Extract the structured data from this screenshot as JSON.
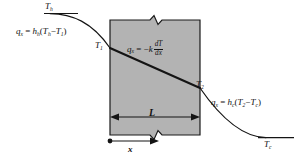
{
  "figure": {
    "colors": {
      "wall_fill": "#b3b3b3",
      "wall_stroke": "#1a1a1a",
      "curve": "#141414",
      "text": "#111111",
      "background": "#ffffff"
    }
  },
  "labels": {
    "hot_fluid_temperature": {
      "symbol": "T",
      "subscript": "h",
      "overline": true
    },
    "cold_fluid_temperature": {
      "symbol": "T",
      "subscript": "c",
      "overline": true
    },
    "wall_surface_hot": {
      "symbol": "T",
      "subscript": "1"
    },
    "wall_surface_cold": {
      "symbol": "T",
      "subscript": "2"
    },
    "wall_thickness": {
      "symbol": "L"
    },
    "axis_x": {
      "symbol": "x"
    }
  },
  "equations": {
    "hot_side_convection": {
      "flux": "q",
      "flux_subscript": "x",
      "equals": "=",
      "coefficient": "h",
      "coefficient_subscript": "h",
      "open_paren": "(",
      "temp1": "T",
      "temp1_subscript": "h",
      "minus": "−",
      "temp2": "T",
      "temp2_subscript": "1",
      "close_paren": ")"
    },
    "conduction_fourier": {
      "flux": "q",
      "flux_subscript": "x",
      "equals": "=",
      "minus": "−",
      "conductivity": "k",
      "numerator": "dT",
      "denominator": "dx"
    },
    "cold_side_convection": {
      "flux": "q",
      "flux_subscript": "x",
      "equals": "=",
      "coefficient": "h",
      "coefficient_subscript": "c",
      "open_paren": "(",
      "temp1": "T",
      "temp1_subscript": "2",
      "minus": "−",
      "temp2": "T",
      "temp2_subscript": "c",
      "close_paren": ")"
    }
  },
  "geometry": {
    "wall_left_px": 110,
    "wall_right_px": 200,
    "wall_top_px": 20,
    "wall_bottom_px": 135,
    "surface_temp_1_y_px": 48,
    "surface_temp_2_y_px": 88,
    "hot_asymptote_y_px": 14,
    "cold_asymptote_y_px": 138,
    "dimension_line_y_px": 117,
    "x_axis_y_px": 141
  }
}
